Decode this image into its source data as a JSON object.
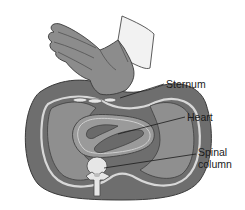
{
  "figure": {
    "labels": {
      "sternum": "Sternum",
      "heart": "Heart",
      "spinal_line1": "Spinal",
      "spinal_line2": "column"
    },
    "colors": {
      "body_dark": "#6e6e6e",
      "body_mid": "#8a8a8a",
      "lung": "#8f8f8f",
      "outline_light": "#d8d8d8",
      "heart_chamber": "#6a6a6a",
      "glove": "#8c8c8c",
      "sleeve": "#f2f2f2",
      "bone": "#e6e6e6",
      "text": "#1a1a1a"
    }
  }
}
